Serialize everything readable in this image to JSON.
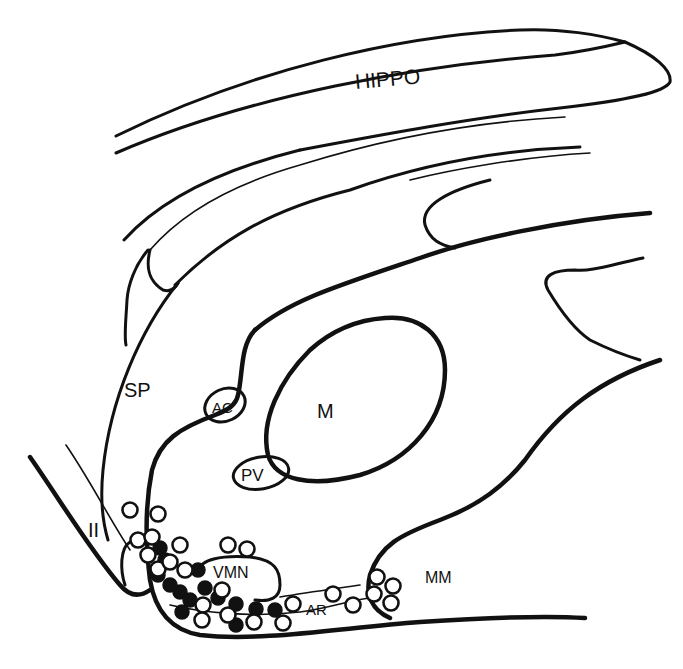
{
  "figure": {
    "type": "sagittal brain section diagram",
    "colors": {
      "ink": "#111111",
      "background": "#ffffff"
    },
    "labels": {
      "hippo": "HIPPO",
      "sp": "SP",
      "ac": "AC",
      "m": "M",
      "pv": "PV",
      "vmn": "VMN",
      "ar": "AR",
      "mm": "MM",
      "optic": "II"
    },
    "legend_symbols": {
      "open_circle": "open-circle-cell-marker",
      "filled_circle": "filled-circle-cell-marker"
    }
  }
}
